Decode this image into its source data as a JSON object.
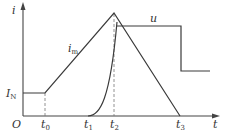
{
  "diagram": {
    "axes": {
      "y_label": "i",
      "x_label": "t",
      "origin_label": "O"
    },
    "level_labels": {
      "rated_current": "I",
      "rated_current_sub": "N"
    },
    "time_ticks": [
      {
        "main": "t",
        "sub": "0"
      },
      {
        "main": "t",
        "sub": "1"
      },
      {
        "main": "t",
        "sub": "2"
      },
      {
        "main": "t",
        "sub": "3"
      }
    ],
    "curves": {
      "current": {
        "main": "i",
        "sub": "m"
      },
      "voltage": "u"
    },
    "colors": {
      "line": "#3a3a3a",
      "dashed": "#777777",
      "background": "#ffffff"
    }
  }
}
